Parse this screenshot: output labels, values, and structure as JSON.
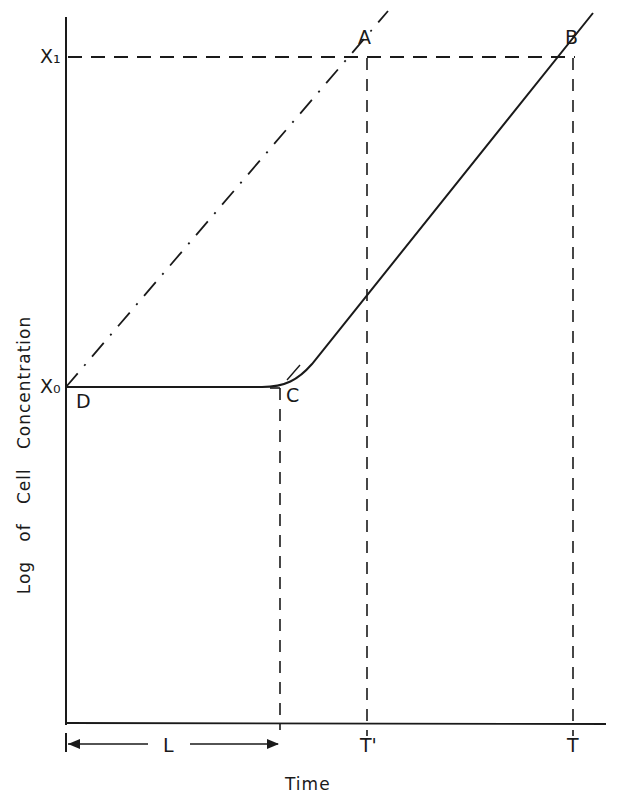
{
  "diagram": {
    "x_axis_label": "Time",
    "y_axis_label": "Log   of   Cell   Concentration",
    "y_levels": {
      "x1": "X₁",
      "x0": "X₀"
    },
    "points": {
      "A": "A",
      "B": "B",
      "C": "C",
      "D": "D"
    },
    "time_ticks": {
      "t_prime": "T'",
      "t": "T"
    },
    "lag_label": "L",
    "colors": {
      "ink": "#1a1a1a",
      "background": "#ffffff"
    },
    "lines": [
      {
        "name": "ideal-growth-line",
        "style": "dash-dot",
        "from": "D",
        "to": "A",
        "description": "exponential growth without lag"
      },
      {
        "name": "actual-growth-curve",
        "style": "solid",
        "from": "D",
        "via": "C",
        "to": "B",
        "description": "growth with lag phase L"
      },
      {
        "name": "x1-level-line",
        "style": "dashed"
      },
      {
        "name": "lag-end-line",
        "style": "dashed"
      },
      {
        "name": "t-prime-line",
        "style": "dashed"
      },
      {
        "name": "t-line",
        "style": "dashed"
      }
    ]
  }
}
